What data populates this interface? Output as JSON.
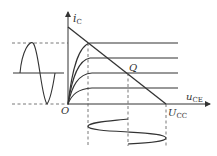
{
  "diagram": {
    "labels": {
      "y_axis": "i",
      "y_axis_sub": "C",
      "x_axis": "u",
      "x_axis_sub": "CE",
      "origin": "O",
      "q_point": "Q",
      "ucc": "U",
      "ucc_sub": "CC"
    },
    "colors": {
      "line": "#333333",
      "dashed": "#555555",
      "background": "#ffffff"
    }
  }
}
